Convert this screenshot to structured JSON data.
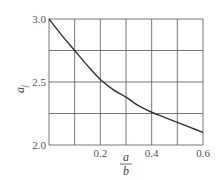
{
  "chart_data": {
    "type": "line",
    "title": "",
    "xlabel": "a/b",
    "xlabel_numerator": "a",
    "xlabel_denominator": "b",
    "ylabel": "a_j",
    "ylabel_main": "a",
    "ylabel_sub": "j",
    "xlim": [
      0,
      0.6
    ],
    "ylim": [
      2.0,
      3.0
    ],
    "grid": true,
    "x_gridlines": [
      0,
      0.1,
      0.2,
      0.3,
      0.4,
      0.5,
      0.6
    ],
    "y_gridlines": [
      2.0,
      2.25,
      2.5,
      2.75,
      3.0
    ],
    "x_tick_labels": [
      {
        "value": 0.2,
        "label": "0.2"
      },
      {
        "value": 0.4,
        "label": "0.4"
      },
      {
        "value": 0.6,
        "label": "0.6"
      }
    ],
    "y_tick_labels": [
      {
        "value": 2.0,
        "label": "2.0"
      },
      {
        "value": 2.5,
        "label": "2.5"
      },
      {
        "value": 3.0,
        "label": "3.0"
      }
    ],
    "series": [
      {
        "name": "a_j",
        "x": [
          0,
          0.05,
          0.1,
          0.15,
          0.2,
          0.25,
          0.3,
          0.35,
          0.4,
          0.45,
          0.5,
          0.55,
          0.6
        ],
        "values": [
          3.0,
          2.87,
          2.75,
          2.63,
          2.52,
          2.44,
          2.38,
          2.31,
          2.26,
          2.22,
          2.18,
          2.14,
          2.1
        ]
      }
    ],
    "legend": null
  },
  "colors": {
    "grid": "#555555",
    "curve": "#333333",
    "text": "#555555"
  }
}
